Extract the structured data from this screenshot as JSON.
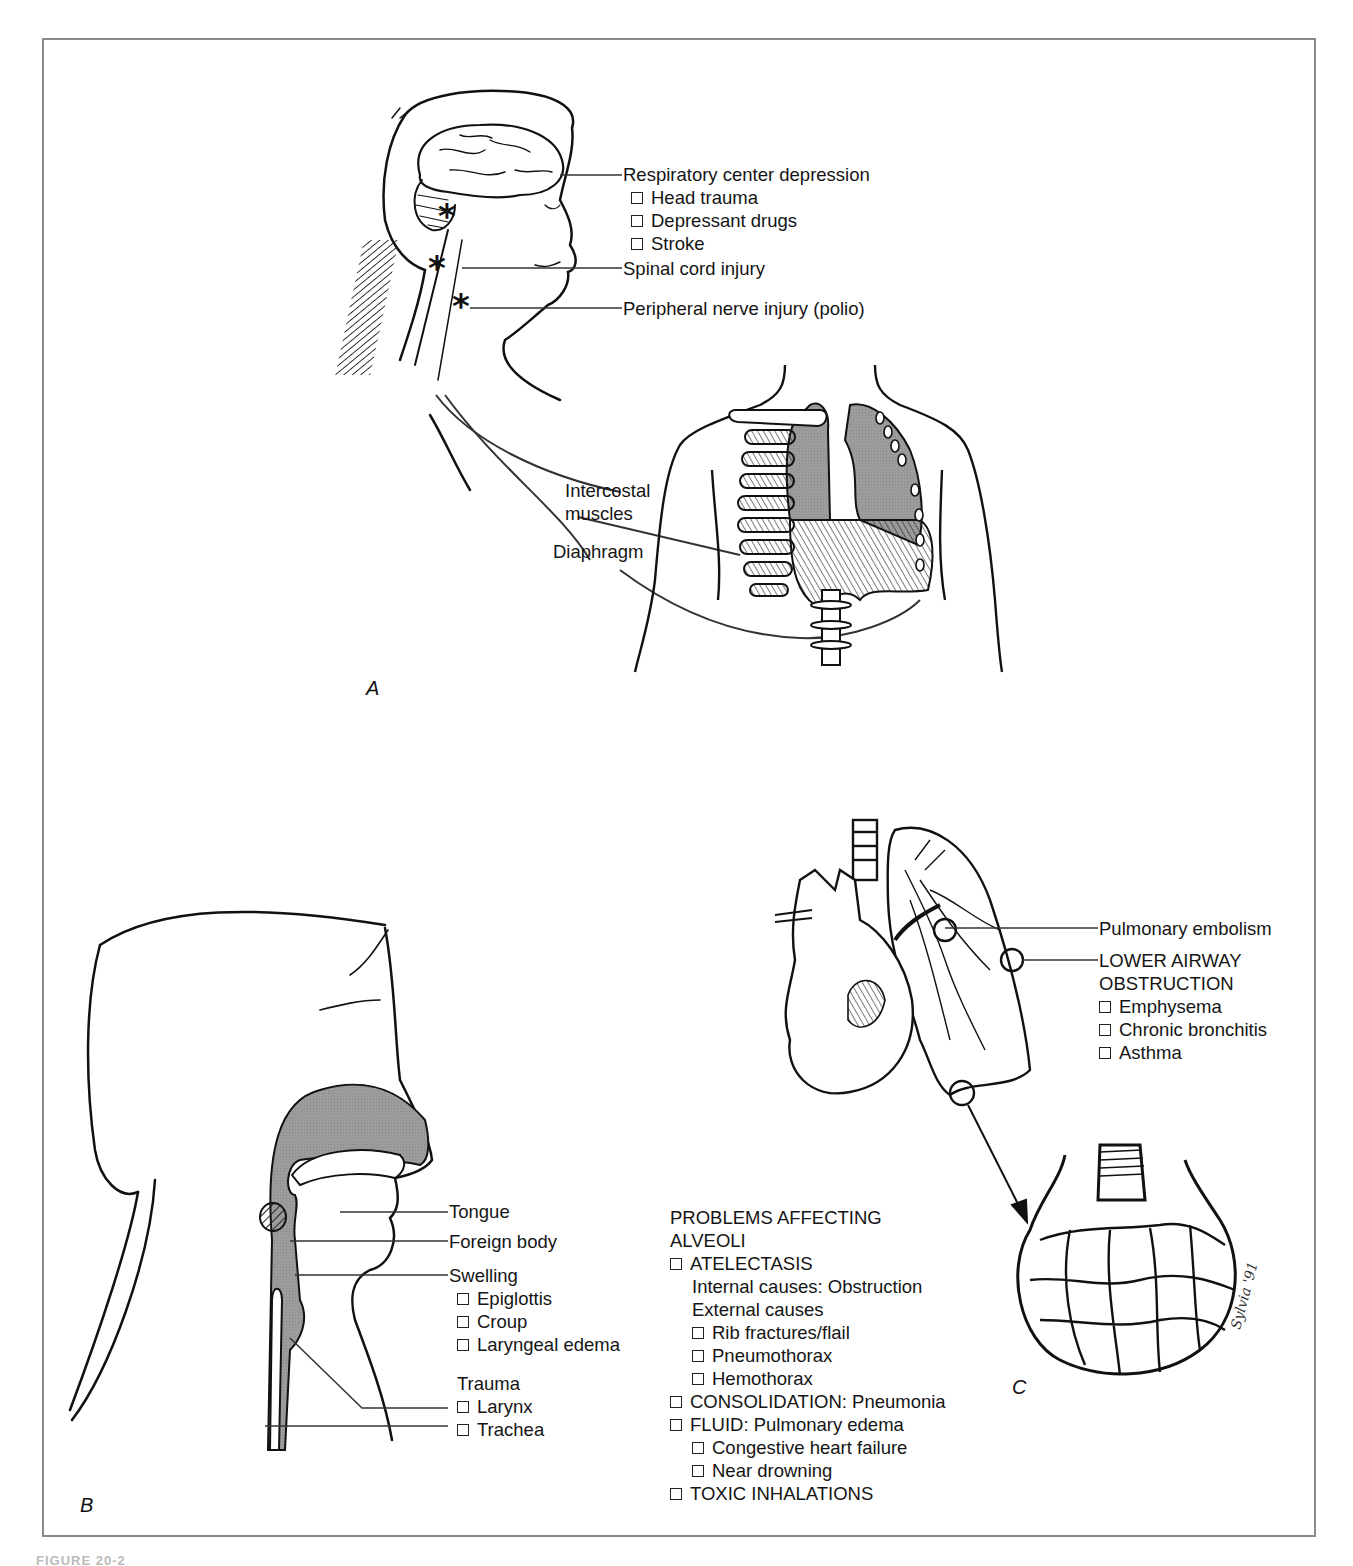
{
  "figure": {
    "caption_fragment": "FIGURE 20-2",
    "border_color": "#8a8a8a",
    "shade_color": "#9a9a9a"
  },
  "panel_a": {
    "letter": "A",
    "respiratory_center": {
      "title": "Respiratory center depression",
      "items": [
        "Head trauma",
        "Depressant drugs",
        "Stroke"
      ]
    },
    "spinal_cord": "Spinal cord injury",
    "peripheral_nerve": "Peripheral nerve injury (polio)",
    "intercostal_line1": "Intercostal",
    "intercostal_line2": "muscles",
    "diaphragm": "Diaphragm"
  },
  "panel_b": {
    "letter": "B",
    "tongue": "Tongue",
    "foreign_body": "Foreign body",
    "swelling": {
      "title": "Swelling",
      "items": [
        "Epiglottis",
        "Croup",
        "Laryngeal edema"
      ]
    },
    "trauma": {
      "title": "Trauma",
      "items": [
        "Larynx",
        "Trachea"
      ]
    }
  },
  "panel_c": {
    "letter": "C",
    "pulmonary_embolism": "Pulmonary embolism",
    "lower_airway": {
      "title_line1": "LOWER AIRWAY",
      "title_line2": "OBSTRUCTION",
      "items": [
        "Emphysema",
        "Chronic bronchitis",
        "Asthma"
      ]
    },
    "alveoli": {
      "title_line1": "PROBLEMS AFFECTING",
      "title_line2": "ALVEOLI",
      "atelectasis": "ATELECTASIS",
      "internal": "Internal causes: Obstruction",
      "external": "External causes",
      "external_items": [
        "Rib fractures/flail",
        "Pneumothorax",
        "Hemothorax"
      ],
      "consolidation": "CONSOLIDATION: Pneumonia",
      "fluid": "FLUID: Pulmonary edema",
      "fluid_items": [
        "Congestive heart failure",
        "Near drowning"
      ],
      "toxic": "TOXIC INHALATIONS"
    }
  }
}
